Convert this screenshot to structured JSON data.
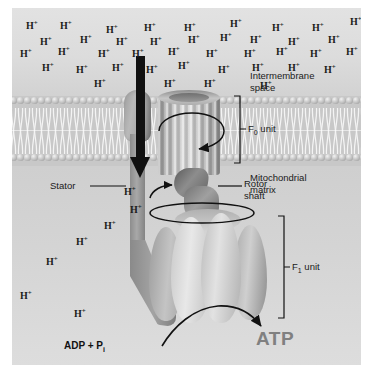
{
  "figure": {
    "labels": {
      "intermembrane_space": "Intermembrane\nspace",
      "mitochondrial_matrix": "Mitochondrial\nmatrix",
      "stator": "Stator",
      "rotor_shaft": "Rotor\nshaft",
      "f0_unit": "F",
      "f0_sub": "0",
      "f0_suffix": " unit",
      "f1_unit": "F",
      "f1_sub": "1",
      "f1_suffix": " unit",
      "adp": "ADP + P",
      "adp_sub": "i",
      "atp": "ATP",
      "proton_channel": "H",
      "proton_sup": "+"
    },
    "colors": {
      "intermembrane_bg": "#dcdcdc",
      "matrix_bg": "#d2d2d2",
      "membrane_bg": "#c8c8c8",
      "atp_text": "#808080",
      "label_text": "#1a1a1a",
      "arrow": "#111111"
    },
    "proton_ions": {
      "symbol": "H",
      "charge": "+",
      "intermembrane_count": 40,
      "matrix_count": 6,
      "channel_count": 1,
      "intermembrane_positions": [
        [
          14,
          12
        ],
        [
          48,
          12
        ],
        [
          94,
          16
        ],
        [
          132,
          14
        ],
        [
          172,
          14
        ],
        [
          218,
          10
        ],
        [
          260,
          14
        ],
        [
          300,
          14
        ],
        [
          338,
          8
        ],
        [
          28,
          28
        ],
        [
          68,
          26
        ],
        [
          104,
          28
        ],
        [
          138,
          28
        ],
        [
          176,
          26
        ],
        [
          208,
          24
        ],
        [
          238,
          26
        ],
        [
          276,
          28
        ],
        [
          316,
          26
        ],
        [
          8,
          40
        ],
        [
          46,
          38
        ],
        [
          86,
          40
        ],
        [
          120,
          40
        ],
        [
          156,
          38
        ],
        [
          194,
          40
        ],
        [
          232,
          40
        ],
        [
          264,
          38
        ],
        [
          298,
          40
        ],
        [
          334,
          38
        ],
        [
          30,
          54
        ],
        [
          64,
          56
        ],
        [
          100,
          54
        ],
        [
          134,
          56
        ],
        [
          166,
          52
        ],
        [
          206,
          56
        ],
        [
          240,
          54
        ],
        [
          276,
          54
        ],
        [
          312,
          56
        ],
        [
          82,
          70
        ],
        [
          152,
          70
        ],
        [
          192,
          70
        ],
        [
          248,
          72
        ]
      ],
      "matrix_positions": [
        [
          118,
          196
        ],
        [
          92,
          212
        ],
        [
          64,
          228
        ],
        [
          34,
          248
        ],
        [
          8,
          282
        ],
        [
          62,
          300
        ]
      ],
      "channel_position": [
        112,
        178
      ]
    }
  }
}
